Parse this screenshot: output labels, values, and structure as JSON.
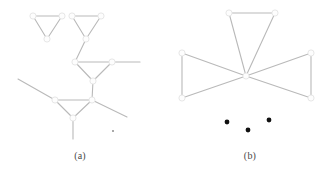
{
  "figure": {
    "width": 330,
    "height": 174,
    "background": "#ffffff",
    "edge_color": "#b9b9b9",
    "vertex_fill": "#fdfdfd",
    "vertex_stroke": "#e3e3e3",
    "dot_color": "#111111",
    "caption_color": "#4a4a4a"
  },
  "panels": [
    {
      "id": "a",
      "caption": "(a)",
      "caption_x": 60,
      "caption_y": 150,
      "description": "tree of triangles",
      "vertices": [
        {
          "id": "t1-left",
          "x": 33,
          "y": 16
        },
        {
          "id": "t1-right",
          "x": 62,
          "y": 16
        },
        {
          "id": "t1-apex",
          "x": 47,
          "y": 39
        },
        {
          "id": "t2-left",
          "x": 72,
          "y": 16
        },
        {
          "id": "t2-right",
          "x": 101,
          "y": 16
        },
        {
          "id": "t2-apex",
          "x": 86,
          "y": 39
        },
        {
          "id": "t3-left",
          "x": 75,
          "y": 62
        },
        {
          "id": "t3-right",
          "x": 112,
          "y": 62
        },
        {
          "id": "t3-apex",
          "x": 93,
          "y": 81
        },
        {
          "id": "hub",
          "x": 92,
          "y": 100
        },
        {
          "id": "t4-left",
          "x": 55,
          "y": 100
        },
        {
          "id": "t4-apex",
          "x": 73,
          "y": 118
        },
        {
          "id": "stub-up-right",
          "x": 140,
          "y": 62
        },
        {
          "id": "stub-left",
          "x": 18,
          "y": 79
        },
        {
          "id": "stub-down-right",
          "x": 127,
          "y": 117
        },
        {
          "id": "stub-bottom",
          "x": 73,
          "y": 139
        }
      ],
      "edges": [
        {
          "from": "t1-left",
          "to": "t1-right"
        },
        {
          "from": "t1-left",
          "to": "t1-apex"
        },
        {
          "from": "t1-right",
          "to": "t1-apex"
        },
        {
          "from": "t2-left",
          "to": "t2-right"
        },
        {
          "from": "t2-left",
          "to": "t2-apex"
        },
        {
          "from": "t2-right",
          "to": "t2-apex"
        },
        {
          "from": "t2-apex",
          "to": "t3-left"
        },
        {
          "from": "t3-left",
          "to": "t3-right"
        },
        {
          "from": "t3-left",
          "to": "t3-apex"
        },
        {
          "from": "t3-right",
          "to": "t3-apex"
        },
        {
          "from": "t3-right",
          "to": "stub-up-right"
        },
        {
          "from": "t3-apex",
          "to": "hub"
        },
        {
          "from": "hub",
          "to": "t4-left"
        },
        {
          "from": "t4-left",
          "to": "t4-apex"
        },
        {
          "from": "hub",
          "to": "t4-apex"
        },
        {
          "from": "t4-left",
          "to": "stub-left"
        },
        {
          "from": "hub",
          "to": "stub-down-right"
        },
        {
          "from": "t4-apex",
          "to": "stub-bottom"
        }
      ],
      "dots": [
        {
          "x": 113,
          "y": 131,
          "r": 0.7
        }
      ]
    },
    {
      "id": "b",
      "caption": "(b)",
      "caption_x": 230,
      "caption_y": 150,
      "description": "friendship graph: triangles sharing a common hub",
      "vertices": [
        {
          "id": "hub",
          "x": 246,
          "y": 76
        },
        {
          "id": "top-left",
          "x": 229,
          "y": 13
        },
        {
          "id": "top-right",
          "x": 275,
          "y": 13
        },
        {
          "id": "left-top",
          "x": 182,
          "y": 53
        },
        {
          "id": "left-bottom",
          "x": 182,
          "y": 98
        },
        {
          "id": "right-top",
          "x": 311,
          "y": 53
        },
        {
          "id": "right-bottom",
          "x": 311,
          "y": 98
        }
      ],
      "edges": [
        {
          "from": "top-left",
          "to": "top-right"
        },
        {
          "from": "top-left",
          "to": "hub"
        },
        {
          "from": "top-right",
          "to": "hub"
        },
        {
          "from": "left-top",
          "to": "left-bottom"
        },
        {
          "from": "left-top",
          "to": "hub"
        },
        {
          "from": "left-bottom",
          "to": "hub"
        },
        {
          "from": "right-top",
          "to": "right-bottom"
        },
        {
          "from": "right-top",
          "to": "hub"
        },
        {
          "from": "right-bottom",
          "to": "hub"
        }
      ],
      "dots": [
        {
          "x": 227,
          "y": 122,
          "r": 2.4
        },
        {
          "x": 248,
          "y": 130,
          "r": 2.4
        },
        {
          "x": 269,
          "y": 120,
          "r": 2.4
        }
      ]
    }
  ]
}
